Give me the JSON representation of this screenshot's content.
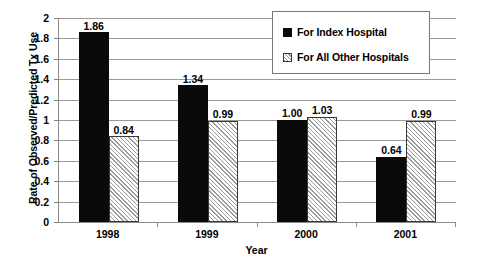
{
  "chart_data": {
    "type": "bar",
    "title": "",
    "xlabel": "Year",
    "ylabel": "Rate of Observed/Predicted Tx Use",
    "categories": [
      "1998",
      "1999",
      "2000",
      "2001"
    ],
    "ylim": [
      0,
      2
    ],
    "ytick_labels": [
      "0",
      "0.2",
      "0.4",
      "0.6",
      "0.8",
      "1",
      "1.2",
      "1.4",
      "1.6",
      "1.8",
      "2"
    ],
    "ytick_values": [
      0,
      0.2,
      0.4,
      0.6,
      0.8,
      1,
      1.2,
      1.4,
      1.6,
      1.8,
      2
    ],
    "grid": true,
    "grid_axis": "y",
    "legend_position": "top-right",
    "series": [
      {
        "name": "For Index Hospital",
        "fill": "solid",
        "color": "#0a0a0a",
        "values": [
          1.86,
          1.34,
          1.0,
          0.64
        ],
        "labels": [
          "1.86",
          "1.34",
          "1.00",
          "0.64"
        ]
      },
      {
        "name": "For All Other Hospitals",
        "fill": "hatch",
        "color": "#9b9b9b",
        "values": [
          0.84,
          0.99,
          1.03,
          0.99
        ],
        "labels": [
          "0.84",
          "0.99",
          "1.03",
          "0.99"
        ]
      }
    ]
  },
  "legend": {
    "items": [
      {
        "label": "For Index Hospital",
        "swatch": "solid"
      },
      {
        "label": "For All Other Hospitals",
        "swatch": "hatch"
      }
    ]
  },
  "axes": {
    "y_title": "Rate of Observed/Predicted Tx Use",
    "x_title": "Year"
  }
}
